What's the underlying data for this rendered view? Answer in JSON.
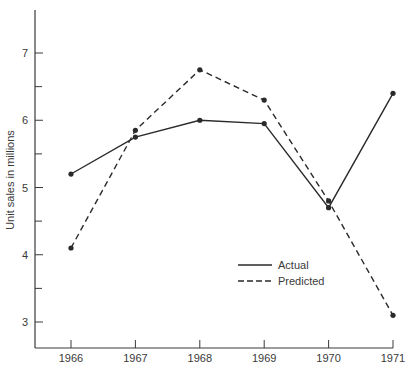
{
  "chart_data": {
    "type": "line",
    "title": "",
    "xlabel": "",
    "ylabel": "Unit sales in millions",
    "x": [
      "1966",
      "1967",
      "1968",
      "1969",
      "1970",
      "1971"
    ],
    "categories": [
      "1966",
      "1967",
      "1968",
      "1969",
      "1970",
      "1971"
    ],
    "series": [
      {
        "name": "Actual",
        "style": "solid",
        "values": [
          5.2,
          5.75,
          6.0,
          5.95,
          4.7,
          6.4
        ]
      },
      {
        "name": "Predicted",
        "style": "dashed",
        "values": [
          4.1,
          5.85,
          6.75,
          6.3,
          4.8,
          3.1
        ]
      }
    ],
    "yticks": [
      3,
      4,
      5,
      6,
      7
    ],
    "yminor_ticks": [
      3.5,
      4.5,
      5.5,
      6.5
    ],
    "ylim": [
      2.6,
      7.6
    ],
    "grid": false,
    "legend": {
      "position": "lower-right-inside",
      "entries": [
        "Actual",
        "Predicted"
      ]
    },
    "colors": {
      "line": "#2a2a2a",
      "axis": "#3a3a3a",
      "text": "#3a3a3a",
      "background": "#ffffff"
    }
  }
}
